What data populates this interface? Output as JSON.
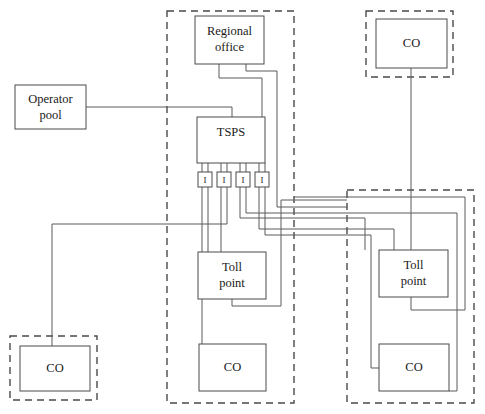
{
  "diagram": {
    "canvas": {
      "width": 485,
      "height": 414
    },
    "colors": {
      "background": "#ffffff",
      "node_stroke": "#4a4a4a",
      "zone_stroke": "#4a4a4a",
      "link_stroke": "#5a5a5a",
      "text": "#1a1a1a"
    },
    "zones": [
      {
        "id": "zone-middle",
        "x": 167,
        "y": 11,
        "w": 127,
        "h": 392,
        "style": "dashed"
      },
      {
        "id": "zone-top-right",
        "x": 366,
        "y": 11,
        "w": 87,
        "h": 66,
        "style": "dashed"
      },
      {
        "id": "zone-bottom-right",
        "x": 347,
        "y": 190,
        "w": 127,
        "h": 213,
        "style": "dashed"
      },
      {
        "id": "zone-bottom-left",
        "x": 10,
        "y": 336,
        "w": 87,
        "h": 64,
        "style": "dashed"
      }
    ],
    "nodes": [
      {
        "id": "operator-pool",
        "label_line1": "Operator",
        "label_line2": "pool",
        "x": 15,
        "y": 85,
        "w": 71,
        "h": 44
      },
      {
        "id": "regional-office",
        "label_line1": "Regional",
        "label_line2": "office",
        "x": 195,
        "y": 16,
        "w": 69,
        "h": 48
      },
      {
        "id": "tsps",
        "label_line1": "TSPS",
        "label_line2": "",
        "x": 197,
        "y": 117,
        "w": 68,
        "h": 46
      },
      {
        "id": "toll-point-middle",
        "label_line1": "Toll",
        "label_line2": "point",
        "x": 198,
        "y": 252,
        "w": 68,
        "h": 47
      },
      {
        "id": "toll-point-right",
        "label_line1": "Toll",
        "label_line2": "point",
        "x": 379,
        "y": 250,
        "w": 69,
        "h": 47
      },
      {
        "id": "co-top-right",
        "label_line1": "CO",
        "label_line2": "",
        "x": 376,
        "y": 19,
        "w": 71,
        "h": 49
      },
      {
        "id": "co-bottom-middle",
        "label_line1": "CO",
        "label_line2": "",
        "x": 199,
        "y": 344,
        "w": 67,
        "h": 47
      },
      {
        "id": "co-bottom-right",
        "label_line1": "CO",
        "label_line2": "",
        "x": 379,
        "y": 344,
        "w": 70,
        "h": 47
      },
      {
        "id": "co-bottom-left",
        "label_line1": "CO",
        "label_line2": "",
        "x": 20,
        "y": 346,
        "w": 70,
        "h": 45
      }
    ],
    "interfaces": [
      {
        "id": "iface-1",
        "label": "I",
        "x": 198,
        "y": 172,
        "w": 14,
        "h": 15
      },
      {
        "id": "iface-2",
        "label": "I",
        "x": 217,
        "y": 172,
        "w": 14,
        "h": 15
      },
      {
        "id": "iface-3",
        "label": "I",
        "x": 236,
        "y": 172,
        "w": 14,
        "h": 15
      },
      {
        "id": "iface-4",
        "label": "I",
        "x": 255,
        "y": 172,
        "w": 14,
        "h": 15
      }
    ],
    "links": [
      {
        "id": "link-operator-pool-to-tsps",
        "path": "M 86 107 L 232 107 L 232 117"
      },
      {
        "id": "link-regional-office-to-tsps",
        "path": "M 219 64 L 219 78 L 262 78 L 262 117"
      },
      {
        "id": "link-regional-office-to-right-bus",
        "path": "M 246 64 L 246 71 L 277 71 L 277 207 L 347 207"
      },
      {
        "id": "link-co-topright-to-rightzone",
        "path": "M 411 68 L 411 250"
      },
      {
        "id": "link-tsps-port-1",
        "path": "M 202 163 L 202 172"
      },
      {
        "id": "link-tsps-port-2",
        "path": "M 221 163 L 221 172"
      },
      {
        "id": "link-tsps-port-3",
        "path": "M 240 163 L 240 172"
      },
      {
        "id": "link-tsps-port-4",
        "path": "M 259 163 L 259 172"
      },
      {
        "id": "link-tsps-port-1b",
        "path": "M 208 163 L 208 172"
      },
      {
        "id": "link-tsps-port-2b",
        "path": "M 227 163 L 227 172"
      },
      {
        "id": "link-tsps-port-3b",
        "path": "M 246 163 L 246 172"
      },
      {
        "id": "link-tsps-port-4b",
        "path": "M 265 163 L 265 172"
      },
      {
        "id": "link-iface1-a-to-co-middle",
        "path": "M 202 187 L 202 368 L 199 368"
      },
      {
        "id": "link-iface1-b-to-toll-middle",
        "path": "M 208 187 L 208 252"
      },
      {
        "id": "link-iface2-a-to-toll-middle",
        "path": "M 221 187 L 221 252"
      },
      {
        "id": "link-iface2-b-to-left-bus",
        "path": "M 227 187 L 227 224 L 52 224 L 52 368 L 90 368"
      },
      {
        "id": "link-iface3-a-to-right",
        "path": "M 240 187 L 240 218 L 365 218 L 365 250"
      },
      {
        "id": "link-iface3-b-to-right",
        "path": "M 246 187 L 246 213 L 457 213 L 457 391 L 449 391"
      },
      {
        "id": "link-iface4-a-to-right",
        "path": "M 259 187 L 259 229 L 394 229 L 394 250"
      },
      {
        "id": "link-iface4-b-to-right-co",
        "path": "M 265 187 L 265 235 L 371 235 L 371 368 L 379 368"
      },
      {
        "id": "link-toll-middle-loop",
        "path": "M 232 299 L 232 306 L 281 306 L 281 200 L 347 200"
      },
      {
        "id": "link-toll-right-loop",
        "path": "M 411 297 L 411 310 L 465 310 L 465 197 L 294 197"
      }
    ]
  }
}
